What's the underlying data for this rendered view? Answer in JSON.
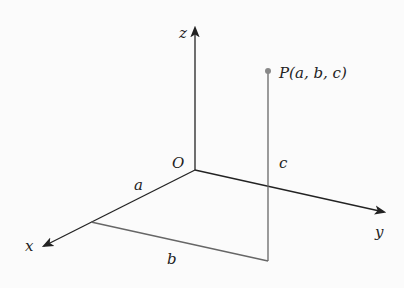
{
  "diagram": {
    "title": "",
    "type": "3d-coordinate-point",
    "origin": {
      "label": "O",
      "x": 195,
      "y": 170
    },
    "axes": [
      {
        "name": "x",
        "label": "x",
        "from": [
          195,
          170
        ],
        "to": [
          42,
          247
        ]
      },
      {
        "name": "y",
        "label": "y",
        "from": [
          195,
          170
        ],
        "to": [
          386,
          213
        ]
      },
      {
        "name": "z",
        "label": "z",
        "from": [
          195,
          170
        ],
        "to": [
          195,
          26
        ]
      }
    ],
    "point": {
      "label": "P(a, b, c)",
      "x": 268,
      "y": 71,
      "color": "#888888"
    },
    "segments": [
      {
        "label": "a",
        "description": "distance along x-axis from O"
      },
      {
        "label": "b",
        "description": "segment parallel to y-axis"
      },
      {
        "label": "c",
        "description": "vertical height to P"
      }
    ],
    "labels": {
      "x": "x",
      "y": "y",
      "z": "z",
      "O": "O",
      "a": "a",
      "b": "b",
      "c": "c",
      "P": "P(a, b, c)"
    },
    "colors": {
      "axis": "#222222",
      "projection": "#666666",
      "background": "#fbfbfb"
    }
  }
}
